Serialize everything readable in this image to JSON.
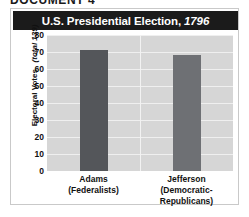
{
  "document_header": "DOCUMENT 4",
  "chart_data": {
    "type": "bar",
    "title": "U.S. Presidential Election,",
    "title_year": "1796",
    "ylabel": "Electoral Votes",
    "ylabel_note": "(total 139)",
    "xlabel": "",
    "ylim": [
      0,
      80
    ],
    "yticks": [
      80,
      70,
      60,
      50,
      40,
      30,
      20,
      10,
      0
    ],
    "grid": true,
    "legend": "none",
    "categories": [
      "Adams",
      "Jefferson"
    ],
    "category_parties": [
      "(Federalists)",
      "(Democratic-Republicans)"
    ],
    "values": [
      71,
      68
    ],
    "bar_colors": [
      "#54565a",
      "#6e7074"
    ],
    "plot_background": "#d6d6d6",
    "title_bar_color": "#1b1b1b"
  }
}
